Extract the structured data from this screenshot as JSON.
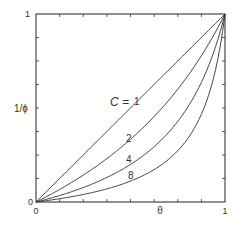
{
  "chart_data": {
    "type": "line",
    "title": "",
    "xlabel": "θ",
    "ylabel": "1/ϕ",
    "xlim": [
      0,
      1
    ],
    "ylim": [
      0,
      1
    ],
    "x_tick_labels": [
      "0",
      "1"
    ],
    "y_tick_labels": [
      "0",
      "1"
    ],
    "minor_ticks_per_axis": 7,
    "grid": false,
    "legend": "none (curves labeled inline)",
    "curve_family_label": "C =",
    "x": [
      0,
      0.1,
      0.2,
      0.3,
      0.4,
      0.5,
      0.6,
      0.7,
      0.8,
      0.9,
      1.0
    ],
    "series": [
      {
        "name": "1",
        "label": "1",
        "values": [
          0,
          0.1,
          0.2,
          0.3,
          0.4,
          0.5,
          0.6,
          0.7,
          0.8,
          0.9,
          1.0
        ]
      },
      {
        "name": "2",
        "label": "2",
        "values": [
          0,
          0.053,
          0.111,
          0.176,
          0.25,
          0.333,
          0.429,
          0.538,
          0.667,
          0.818,
          1.0
        ]
      },
      {
        "name": "4",
        "label": "4",
        "values": [
          0,
          0.027,
          0.059,
          0.097,
          0.143,
          0.2,
          0.273,
          0.368,
          0.5,
          0.692,
          1.0
        ]
      },
      {
        "name": "8",
        "label": "8",
        "values": [
          0,
          0.014,
          0.03,
          0.051,
          0.077,
          0.111,
          0.158,
          0.226,
          0.333,
          0.529,
          1.0
        ]
      }
    ]
  }
}
